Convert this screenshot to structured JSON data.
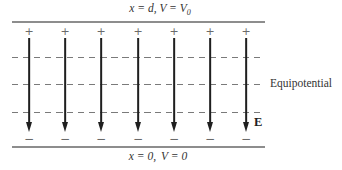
{
  "diagram": {
    "labels": {
      "top_plate_main": "x = d, V = V",
      "top_plate_sub": "0",
      "bottom_plate_left": "x = 0,",
      "bottom_plate_right": "V = 0",
      "equipotential": "Equipotential",
      "field": "E"
    },
    "symbols": {
      "plus": "+",
      "minus": "−"
    },
    "field_lines": {
      "count": 7,
      "x_positions": [
        29,
        65,
        101,
        138,
        174,
        210,
        246
      ],
      "top_y": 38,
      "arrow_tip_y": 132
    },
    "equipotential_lines": {
      "count": 3,
      "y_positions": [
        57,
        84,
        112
      ]
    },
    "plates": {
      "top_y": 21,
      "bottom_y": 146,
      "x_start": 12,
      "x_end": 265
    },
    "colors": {
      "plate_line": "#8d8d8d",
      "field_line": "#1f1f1f",
      "dashed_line": "#7a7a7a",
      "text": "#333333",
      "charge": "#6a6a6a"
    }
  }
}
